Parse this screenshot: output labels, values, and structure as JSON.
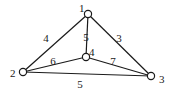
{
  "graph": {
    "nodes": [
      {
        "id": "1",
        "label": "1",
        "x": 88,
        "y": 14,
        "lx": 79,
        "ly": 12
      },
      {
        "id": "2",
        "label": "2",
        "x": 23,
        "y": 72,
        "lx": 10,
        "ly": 77
      },
      {
        "id": "3",
        "label": "3",
        "x": 151,
        "y": 76,
        "lx": 159,
        "ly": 83
      },
      {
        "id": "4",
        "label": "4",
        "x": 86,
        "y": 57,
        "lx": 86,
        "ly": 56
      }
    ],
    "edges": [
      {
        "from": "1",
        "to": "2",
        "weight": "4",
        "lx": 46,
        "ly": 42
      },
      {
        "from": "1",
        "to": "3",
        "weight": "3",
        "lx": 119,
        "ly": 42
      },
      {
        "from": "1",
        "to": "4",
        "weight": "5",
        "lx": 86,
        "ly": 41
      },
      {
        "from": "2",
        "to": "4",
        "weight": "6",
        "lx": 53,
        "ly": 65
      },
      {
        "from": "4",
        "to": "3",
        "weight": "7",
        "lx": 113,
        "ly": 65
      },
      {
        "from": "2",
        "to": "3",
        "weight": "5",
        "lx": 80,
        "ly": 88
      }
    ]
  }
}
